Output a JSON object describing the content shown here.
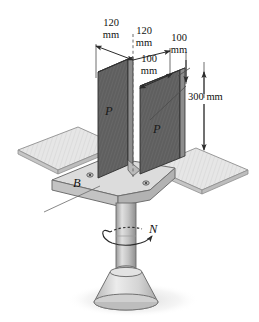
{
  "figure": {
    "name": "column-base-isometric",
    "background_color": "#ffffff"
  },
  "dimensions": [
    {
      "id": "dim-120-left",
      "value": "120",
      "unit": "mm",
      "text": "120\nmm"
    },
    {
      "id": "dim-120-right",
      "value": "120",
      "unit": "mm",
      "text": "120\nmm"
    },
    {
      "id": "dim-100-right",
      "value": "100",
      "unit": "mm",
      "text": "100\nmm"
    },
    {
      "id": "dim-100-inner",
      "value": "100",
      "unit": "mm",
      "text": "100\nmm"
    },
    {
      "id": "dim-300",
      "value": "300",
      "unit": "mm",
      "text": "300 mm"
    }
  ],
  "labels": {
    "force_left": "P",
    "force_right": "P",
    "base_point": "B",
    "torque": "N"
  },
  "colors": {
    "plate_dark": "#5d5d5d",
    "plate_light": "#d8d8d8",
    "plate_edge": "#8a8a8a",
    "outline": "#3a3a3a",
    "column": "#b8b8b8",
    "pedestal": "#cfcfcf",
    "shadow": "#e4e4e4",
    "dimension_line": "#2b2b2b"
  }
}
